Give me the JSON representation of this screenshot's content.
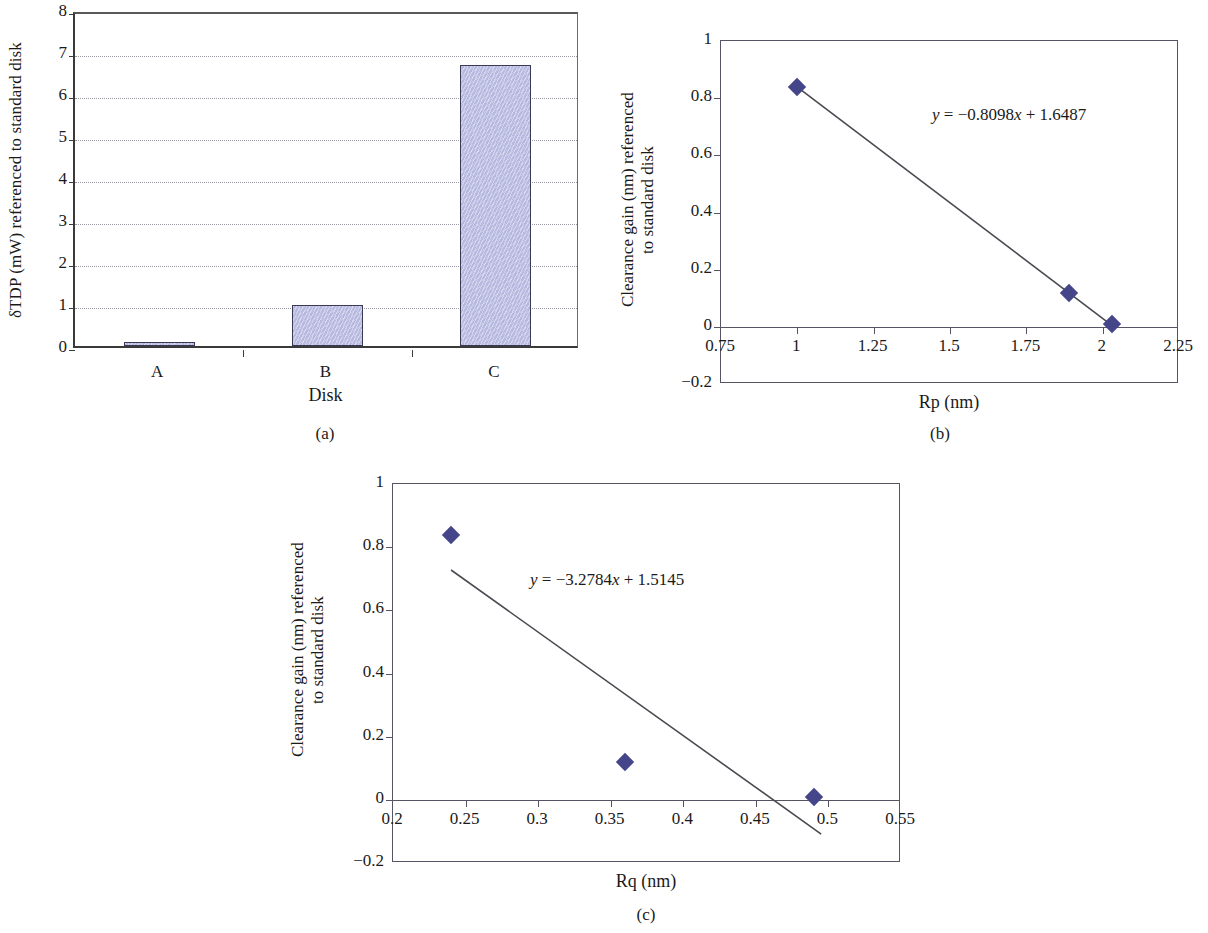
{
  "figure": {
    "panel_captions": [
      "(a)",
      "(b)",
      "(c)"
    ]
  },
  "colors": {
    "bar_fill": "#bfc0e6",
    "bar_stroke": "#3a3a55",
    "marker": "#45458a",
    "axis": "#555566",
    "grid": "#9a9aa6"
  },
  "chart_data": [
    {
      "type": "bar",
      "panel": "(a)",
      "title": "",
      "xlabel": "Disk",
      "ylabel": "δTDP (mW) referenced to standard disk",
      "categories": [
        "A",
        "B",
        "C"
      ],
      "values": [
        0.1,
        0.97,
        6.7
      ],
      "ylim": [
        0,
        8
      ],
      "yticks": [
        "0",
        "1",
        "2",
        "3",
        "4",
        "5",
        "6",
        "7",
        "8"
      ],
      "ytick_values": [
        0,
        1,
        2,
        3,
        4,
        5,
        6,
        7,
        8
      ],
      "grid": true,
      "legend": "none"
    },
    {
      "type": "scatter",
      "panel": "(b)",
      "title": "",
      "xlabel": "Rp (nm)",
      "ylabel_line1": "Clearance gain (nm) referenced",
      "ylabel_line2": "to standard disk",
      "x": [
        1.0,
        1.89,
        2.03
      ],
      "y": [
        0.84,
        0.12,
        0.01
      ],
      "xlim": [
        0.75,
        2.25
      ],
      "ylim": [
        -0.2,
        1
      ],
      "xticks": [
        "0.75",
        "1",
        "1.25",
        "1.5",
        "1.75",
        "2",
        "2.25"
      ],
      "xtick_values": [
        0.75,
        1,
        1.25,
        1.5,
        1.75,
        2,
        2.25
      ],
      "yticks": [
        "1",
        "0.8",
        "0.6",
        "0.4",
        "0.2",
        "0",
        "−0.2"
      ],
      "ytick_values": [
        1,
        0.8,
        0.6,
        0.4,
        0.2,
        0,
        -0.2
      ],
      "annotation": "y = −0.8098x + 1.6487",
      "annotation_parts": {
        "lhs": "y",
        "eq": " = −0.8098",
        "var": "x",
        "rhs": " + 1.6487"
      },
      "trendline": {
        "slope": -0.8098,
        "intercept": 1.6487,
        "x_start": 1.0,
        "x_end": 2.03
      },
      "grid": false,
      "legend": "none"
    },
    {
      "type": "scatter",
      "panel": "(c)",
      "title": "",
      "xlabel": "Rq (nm)",
      "ylabel_line1": "Clearance gain (nm) referenced",
      "ylabel_line2": "to standard disk",
      "x": [
        0.24,
        0.36,
        0.49
      ],
      "y": [
        0.84,
        0.12,
        0.01
      ],
      "xlim": [
        0.2,
        0.55
      ],
      "ylim": [
        -0.2,
        1
      ],
      "xticks": [
        "0.2",
        "0.25",
        "0.3",
        "0.35",
        "0.4",
        "0.45",
        "0.5",
        "0.55"
      ],
      "xtick_values": [
        0.2,
        0.25,
        0.3,
        0.35,
        0.4,
        0.45,
        0.5,
        0.55
      ],
      "yticks": [
        "1",
        "0.8",
        "0.6",
        "0.4",
        "0.2",
        "0",
        "−0.2"
      ],
      "ytick_values": [
        1,
        0.8,
        0.6,
        0.4,
        0.2,
        0,
        -0.2
      ],
      "annotation": "y = −3.2784x + 1.5145",
      "annotation_parts": {
        "lhs": "y",
        "eq": " = −3.2784",
        "var": "x",
        "rhs": " + 1.5145"
      },
      "trendline": {
        "slope": -3.2784,
        "intercept": 1.5145,
        "x_start": 0.24,
        "x_end": 0.495
      },
      "grid": false,
      "legend": "none"
    }
  ]
}
